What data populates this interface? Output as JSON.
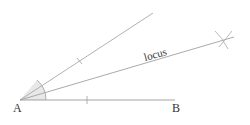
{
  "diagram": {
    "type": "angle-bisector-construction",
    "labels": {
      "vertex": "A",
      "endpoint": "B",
      "bisector": "locus"
    },
    "points": {
      "A": [
        20,
        100
      ],
      "B": [
        175,
        100
      ],
      "upper_ray_end": [
        153,
        13
      ],
      "bisector_end": [
        232,
        38
      ],
      "arc_intersection": [
        225,
        40
      ]
    },
    "colors": {
      "line": "#9a9a9a",
      "text": "#333333",
      "angle_fill": "#e6e6e6"
    }
  }
}
